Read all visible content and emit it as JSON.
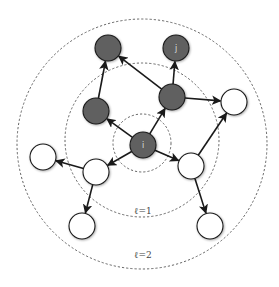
{
  "diagram": {
    "colors": {
      "dark_node": "#616161",
      "light_node": "#ffffff",
      "stroke": "#1a1a1a",
      "ring": "#555555"
    },
    "rings": [
      {
        "id": "ring-0",
        "cx": 142,
        "cy": 143,
        "r": 29,
        "label": ""
      },
      {
        "id": "ring-1",
        "cx": 142,
        "cy": 140,
        "r": 77,
        "label": "ℓ=1",
        "lx": 143,
        "ly": 214
      },
      {
        "id": "ring-2",
        "cx": 142,
        "cy": 144,
        "r": 125,
        "label": "ℓ=2",
        "lx": 143,
        "ly": 258
      }
    ],
    "nodes": [
      {
        "id": "i",
        "label": "i",
        "x": 143,
        "y": 145,
        "dark": true
      },
      {
        "id": "a",
        "label": "",
        "x": 96,
        "y": 111,
        "dark": true
      },
      {
        "id": "b",
        "label": "",
        "x": 172,
        "y": 97,
        "dark": true
      },
      {
        "id": "c",
        "label": "",
        "x": 108,
        "y": 48,
        "dark": true
      },
      {
        "id": "j",
        "label": "j",
        "x": 176,
        "y": 48,
        "dark": true
      },
      {
        "id": "d",
        "label": "",
        "x": 234,
        "y": 102,
        "dark": false
      },
      {
        "id": "e",
        "label": "",
        "x": 96,
        "y": 172,
        "dark": false
      },
      {
        "id": "f",
        "label": "",
        "x": 191,
        "y": 166,
        "dark": false
      },
      {
        "id": "g",
        "label": "",
        "x": 43,
        "y": 157,
        "dark": false
      },
      {
        "id": "h",
        "label": "",
        "x": 82,
        "y": 226,
        "dark": false
      },
      {
        "id": "k",
        "label": "",
        "x": 210,
        "y": 226,
        "dark": false
      }
    ],
    "edges": [
      [
        "i",
        "a"
      ],
      [
        "i",
        "b"
      ],
      [
        "i",
        "e"
      ],
      [
        "i",
        "f"
      ],
      [
        "a",
        "c"
      ],
      [
        "b",
        "c"
      ],
      [
        "b",
        "j"
      ],
      [
        "b",
        "d"
      ],
      [
        "f",
        "d"
      ],
      [
        "f",
        "k"
      ],
      [
        "e",
        "g"
      ],
      [
        "e",
        "h"
      ]
    ],
    "node_radius": 13
  }
}
